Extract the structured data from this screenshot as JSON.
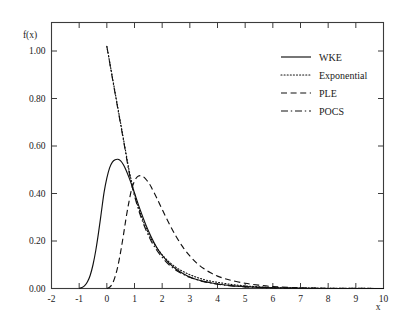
{
  "chart_data": {
    "type": "line",
    "title": "",
    "xlabel": "x",
    "ylabel": "f(x)",
    "xlim": [
      -2,
      10
    ],
    "ylim": [
      0.0,
      1.12
    ],
    "grid": false,
    "legend_position": "top-right",
    "x_ticks": [
      "-2",
      "-1",
      "0",
      "1",
      "2",
      "3",
      "4",
      "5",
      "6",
      "7",
      "8",
      "9",
      "10"
    ],
    "x_tick_values": [
      -2,
      -1,
      0,
      1,
      2,
      3,
      4,
      5,
      6,
      7,
      8,
      9,
      10
    ],
    "y_ticks": [
      "0.00",
      "0.20",
      "0.40",
      "0.60",
      "0.80",
      "1.00"
    ],
    "y_tick_values": [
      0.0,
      0.2,
      0.4,
      0.6,
      0.8,
      1.0
    ],
    "series": [
      {
        "name": "WKE",
        "style": "solid",
        "x": [
          -1.0,
          -0.9,
          -0.8,
          -0.7,
          -0.6,
          -0.5,
          -0.4,
          -0.3,
          -0.2,
          -0.1,
          0.0,
          0.1,
          0.2,
          0.3,
          0.4,
          0.5,
          0.6,
          0.7,
          0.8,
          0.9,
          1.0,
          1.2,
          1.4,
          1.6,
          1.8,
          2.0,
          2.25,
          2.5,
          2.75,
          3.0,
          3.25,
          3.5,
          3.75,
          4.0,
          4.5,
          5.0,
          5.5,
          6.0,
          7.0,
          8.0,
          10.0
        ],
        "y": [
          0.0,
          0.004,
          0.012,
          0.028,
          0.056,
          0.1,
          0.16,
          0.235,
          0.32,
          0.405,
          0.465,
          0.508,
          0.532,
          0.542,
          0.544,
          0.537,
          0.521,
          0.497,
          0.468,
          0.436,
          0.402,
          0.333,
          0.271,
          0.218,
          0.174,
          0.14,
          0.107,
          0.082,
          0.063,
          0.048,
          0.038,
          0.03,
          0.024,
          0.019,
          0.012,
          0.008,
          0.005,
          0.003,
          0.001,
          0.0,
          0.0
        ]
      },
      {
        "name": "Exponential",
        "style": "dotted",
        "x": [
          0.0,
          0.1,
          0.2,
          0.3,
          0.4,
          0.5,
          0.6,
          0.7,
          0.8,
          0.9,
          1.0,
          1.2,
          1.4,
          1.6,
          1.8,
          2.0,
          2.25,
          2.5,
          2.75,
          3.0,
          3.25,
          3.5,
          3.75,
          4.0,
          4.5,
          5.0,
          5.5,
          6.0,
          7.0,
          8.0,
          10.0
        ],
        "y": [
          1.02,
          0.955,
          0.89,
          0.825,
          0.76,
          0.695,
          0.63,
          0.565,
          0.5,
          0.447,
          0.4,
          0.322,
          0.26,
          0.21,
          0.172,
          0.142,
          0.112,
          0.089,
          0.072,
          0.058,
          0.047,
          0.038,
          0.031,
          0.026,
          0.017,
          0.011,
          0.007,
          0.004,
          0.002,
          0.001,
          0.0
        ]
      },
      {
        "name": "PLE",
        "style": "dashed",
        "x": [
          0.0,
          0.1,
          0.2,
          0.3,
          0.4,
          0.5,
          0.6,
          0.7,
          0.8,
          0.9,
          1.0,
          1.1,
          1.2,
          1.3,
          1.4,
          1.5,
          1.6,
          1.8,
          2.0,
          2.25,
          2.5,
          2.75,
          3.0,
          3.25,
          3.5,
          3.75,
          4.0,
          4.25,
          4.5,
          5.0,
          5.5,
          6.0,
          7.0,
          8.0,
          10.0
        ],
        "y": [
          0.0,
          0.005,
          0.02,
          0.05,
          0.095,
          0.155,
          0.225,
          0.3,
          0.365,
          0.42,
          0.452,
          0.47,
          0.475,
          0.472,
          0.462,
          0.447,
          0.428,
          0.382,
          0.333,
          0.274,
          0.22,
          0.174,
          0.137,
          0.107,
          0.084,
          0.066,
          0.052,
          0.042,
          0.034,
          0.022,
          0.014,
          0.008,
          0.003,
          0.001,
          0.0
        ]
      },
      {
        "name": "POCS",
        "style": "dashdot",
        "x": [
          0.0,
          0.1,
          0.2,
          0.3,
          0.4,
          0.5,
          0.6,
          0.7,
          0.8,
          0.9,
          1.0,
          1.2,
          1.4,
          1.6,
          1.8,
          2.0,
          2.25,
          2.5,
          2.75,
          3.0,
          3.25,
          3.5,
          3.75,
          4.0,
          4.5,
          5.0,
          5.5,
          6.0,
          7.0,
          8.0,
          10.0
        ],
        "y": [
          1.02,
          0.953,
          0.886,
          0.82,
          0.755,
          0.69,
          0.625,
          0.558,
          0.492,
          0.438,
          0.39,
          0.312,
          0.25,
          0.2,
          0.162,
          0.131,
          0.1,
          0.077,
          0.06,
          0.047,
          0.037,
          0.029,
          0.023,
          0.018,
          0.011,
          0.007,
          0.004,
          0.002,
          0.001,
          0.0,
          0.0
        ]
      }
    ]
  },
  "legend": {
    "items": [
      {
        "label": "WKE",
        "style": "solid"
      },
      {
        "label": "Exponential",
        "style": "dotted"
      },
      {
        "label": "PLE",
        "style": "dashed"
      },
      {
        "label": "POCS",
        "style": "dashdot"
      }
    ]
  }
}
